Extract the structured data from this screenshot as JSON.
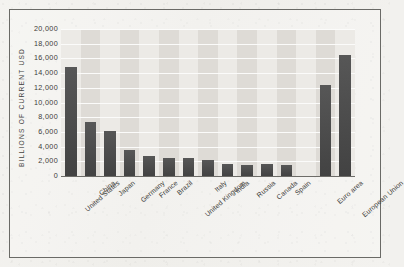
{
  "chart_data": {
    "type": "bar",
    "title": "",
    "subtitle": "",
    "xlabel": "",
    "ylabel": "BILLIONS OF CURRENT USD",
    "ylim": [
      0,
      20000
    ],
    "ytick_labels": [
      "20,000",
      "18,000",
      "16,000",
      "14,000",
      "12,000",
      "10,000",
      "8,000",
      "6,000",
      "4,000",
      "2,000",
      "0"
    ],
    "ytick_values": [
      20000,
      18000,
      16000,
      14000,
      12000,
      10000,
      8000,
      6000,
      4000,
      2000,
      0
    ],
    "grid": "horizontal",
    "legend": "none",
    "categories": [
      "United States",
      "China",
      "Japan",
      "Germany",
      "France",
      "Brazil",
      "United Kingdom",
      "Italy",
      "India",
      "Russia",
      "Canada",
      "Spain",
      "",
      "Euro area",
      "European Union"
    ],
    "values": [
      14900,
      7300,
      6100,
      3600,
      2700,
      2500,
      2450,
      2200,
      1700,
      1500,
      1600,
      1450,
      null,
      12400,
      16400
    ],
    "bar_color": "#4a4a4a",
    "plot_background": "#eceae6",
    "band_color": "#dedbd6",
    "gridline_color": "#fbfbfa"
  }
}
